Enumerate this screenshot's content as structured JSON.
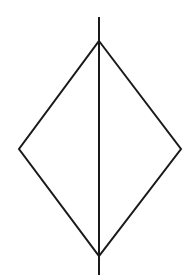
{
  "diagram": {
    "type": "diamond-with-vertical-line",
    "stroke_color": "#1a1a1a",
    "background": "#ffffff",
    "diamond": {
      "top": [
        99,
        41
      ],
      "right": [
        181,
        149
      ],
      "bottom": [
        99,
        256
      ],
      "left": [
        19,
        149
      ]
    },
    "vertical_line": {
      "x": 99,
      "y1": 17,
      "y2": 275
    }
  }
}
